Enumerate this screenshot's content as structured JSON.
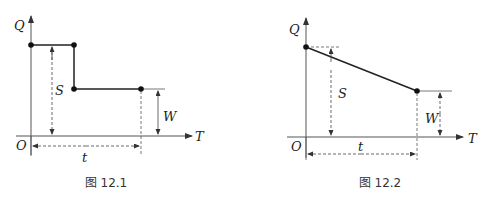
{
  "figures": [
    {
      "id": "fig-12-1",
      "caption": "图 12.1",
      "labels": {
        "y_axis": "Q",
        "x_axis": "T",
        "origin": "O",
        "s": "S",
        "w": "W",
        "t": "t"
      }
    },
    {
      "id": "fig-12-2",
      "caption": "图 12.2",
      "labels": {
        "y_axis": "Q",
        "x_axis": "T",
        "origin": "O",
        "s": "S",
        "w": "W",
        "t": "t"
      }
    }
  ]
}
